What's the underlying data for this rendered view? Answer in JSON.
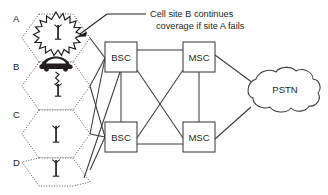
{
  "diagram": {
    "annotation": {
      "line1": "Cell site B continues",
      "line2": "coverage if site A fails"
    },
    "cells": [
      {
        "id": "A",
        "label": "A",
        "icon": "tower-icon",
        "status": "failed",
        "overlay": "explosion-icon"
      },
      {
        "id": "B",
        "label": "B",
        "icon": "tower-icon",
        "status": "active",
        "overlay": "car-icon"
      },
      {
        "id": "C",
        "label": "C",
        "icon": "tower-icon",
        "status": "active",
        "overlay": "none"
      },
      {
        "id": "D",
        "label": "D",
        "icon": "tower-icon",
        "status": "active",
        "overlay": "none"
      }
    ],
    "nodes": [
      {
        "id": "bsc1",
        "label": "BSC",
        "type": "box"
      },
      {
        "id": "bsc2",
        "label": "BSC",
        "type": "box"
      },
      {
        "id": "msc1",
        "label": "MSC",
        "type": "box"
      },
      {
        "id": "msc2",
        "label": "MSC",
        "type": "box"
      },
      {
        "id": "pstn",
        "label": "PSTN",
        "type": "cloud"
      }
    ],
    "colors": {
      "line": "#3b3b3b",
      "text": "#231f20",
      "background": "#ffffff"
    }
  }
}
